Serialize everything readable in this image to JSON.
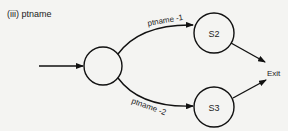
{
  "title": "(iii) ptname",
  "nodes": [
    {
      "id": "start",
      "label": "",
      "cx": 103,
      "cy": 66,
      "r": 19
    },
    {
      "id": "s2",
      "label": "S2",
      "cx": 214,
      "cy": 33,
      "r": 20
    },
    {
      "id": "s3",
      "label": "S3",
      "cx": 214,
      "cy": 107,
      "r": 20
    },
    {
      "id": "exit",
      "label": "Exit"
    }
  ],
  "edges": [
    {
      "from": "entry",
      "to": "start",
      "label": ""
    },
    {
      "from": "start",
      "to": "s2",
      "label": "ptname -1"
    },
    {
      "from": "start",
      "to": "s3",
      "label": "ptname -2"
    },
    {
      "from": "s2",
      "to": "exit",
      "label": ""
    },
    {
      "from": "s3",
      "to": "exit",
      "label": ""
    }
  ],
  "labels": {
    "s2": "S2",
    "s3": "S3",
    "exit": "Exit",
    "edge1": "ptname -1",
    "edge2": "ptname -2"
  }
}
